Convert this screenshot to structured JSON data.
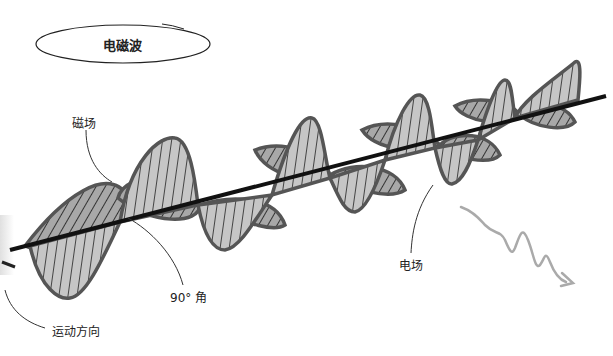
{
  "title": "电磁波",
  "labels": {
    "magnetic_field": "磁场",
    "electric_field": "电场",
    "angle": "90° 角",
    "direction": "运动方向"
  },
  "colors": {
    "lobe_fill": "#c4c4c4",
    "lobe_fill_dark": "#9a9a9a",
    "lobe_stroke": "#555555",
    "axis": "#111111",
    "leader": "#333333",
    "squiggle": "#aaaaaa"
  }
}
